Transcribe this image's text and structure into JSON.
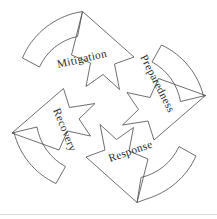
{
  "diagram": {
    "type": "cyclical-process-pinwheel",
    "direction": "clockwise",
    "background_color": "#ffffff",
    "stroke_color": "#555558",
    "text_color": "#2a2a2c",
    "baseline_rule_color": "#d9d9de",
    "phase_count": 4,
    "phases": [
      {
        "id": "mitigation",
        "label": "Mitigation",
        "position": "top-left",
        "order": 1,
        "text_rotation_deg": -13,
        "label_x": 58,
        "label_y": 68,
        "arrow_points_toward": "up-right"
      },
      {
        "id": "preparedness",
        "label": "Preparedness",
        "position": "top-right",
        "order": 2,
        "text_rotation_deg": 63,
        "label_x": 140,
        "label_y": 57,
        "arrow_points_toward": "down-right"
      },
      {
        "id": "response",
        "label": "Response",
        "position": "bottom-right",
        "order": 3,
        "text_rotation_deg": -19,
        "label_x": 110,
        "label_y": 162,
        "arrow_points_toward": "down-left"
      },
      {
        "id": "recovery",
        "label": "Recovery",
        "position": "bottom-left",
        "order": 4,
        "text_rotation_deg": 68,
        "label_x": 53,
        "label_y": 110,
        "arrow_points_toward": "up-left"
      }
    ]
  }
}
